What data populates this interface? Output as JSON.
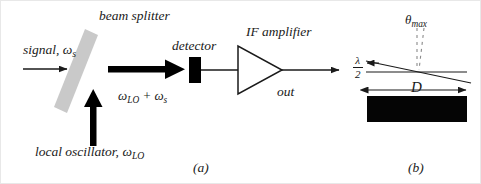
{
  "figure": {
    "caption_a": "(a)",
    "caption_b": "(b)"
  },
  "panel_a": {
    "beam_splitter_label": "beam splitter",
    "signal_label_text": "signal, ",
    "signal_symbol": "ω",
    "signal_subscript": "s",
    "local_oscillator_text": "local oscillator, ",
    "local_oscillator_symbol": "ω",
    "local_oscillator_subscript": "LO",
    "mixed_first_symbol": "ω",
    "mixed_first_subscript": "LO",
    "mixed_operator": " + ",
    "mixed_second_symbol": "ω",
    "mixed_second_subscript": "s",
    "detector_label": "detector",
    "amplifier_label": "IF amplifier",
    "output_label": "out"
  },
  "panel_b": {
    "theta_symbol": "θ",
    "theta_subscript": "max",
    "wavelength_numerator": "λ",
    "wavelength_denominator": "2",
    "aperture_label": "D"
  },
  "colors": {
    "ink": "#1a1a1a",
    "beam_splitter": "#c9c9c9",
    "detector_fill": "#000000",
    "aperture_fill": "#050505",
    "background": "#ffffff",
    "dashed_guide": "#8a8a8a"
  }
}
